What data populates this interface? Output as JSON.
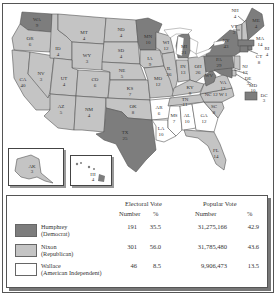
{
  "colors": {
    "humphrey": "#7d7d7d",
    "nixon": "#c4c4c4",
    "wallace": "#ffffff",
    "border": "#555555"
  },
  "states": [
    {
      "abbr": "WA",
      "ev": "9",
      "winner": "humphrey"
    },
    {
      "abbr": "OR",
      "ev": "6",
      "winner": "nixon"
    },
    {
      "abbr": "CA",
      "ev": "40",
      "winner": "nixon"
    },
    {
      "abbr": "ID",
      "ev": "4",
      "winner": "nixon"
    },
    {
      "abbr": "NV",
      "ev": "3",
      "winner": "nixon"
    },
    {
      "abbr": "MT",
      "ev": "4",
      "winner": "nixon"
    },
    {
      "abbr": "WY",
      "ev": "3",
      "winner": "nixon"
    },
    {
      "abbr": "UT",
      "ev": "4",
      "winner": "nixon"
    },
    {
      "abbr": "AZ",
      "ev": "5",
      "winner": "nixon"
    },
    {
      "abbr": "CO",
      "ev": "6",
      "winner": "nixon"
    },
    {
      "abbr": "NM",
      "ev": "4",
      "winner": "nixon"
    },
    {
      "abbr": "ND",
      "ev": "4",
      "winner": "nixon"
    },
    {
      "abbr": "SD",
      "ev": "4",
      "winner": "nixon"
    },
    {
      "abbr": "NE",
      "ev": "5",
      "winner": "nixon"
    },
    {
      "abbr": "KS",
      "ev": "7",
      "winner": "nixon"
    },
    {
      "abbr": "OK",
      "ev": "8",
      "winner": "nixon"
    },
    {
      "abbr": "TX",
      "ev": "25",
      "winner": "humphrey"
    },
    {
      "abbr": "MN",
      "ev": "10",
      "winner": "humphrey"
    },
    {
      "abbr": "IA",
      "ev": "9",
      "winner": "nixon"
    },
    {
      "abbr": "MO",
      "ev": "12",
      "winner": "nixon"
    },
    {
      "abbr": "AR",
      "ev": "6",
      "winner": "wallace"
    },
    {
      "abbr": "LA",
      "ev": "10",
      "winner": "wallace"
    },
    {
      "abbr": "WI",
      "ev": "12",
      "winner": "nixon"
    },
    {
      "abbr": "IL",
      "ev": "26",
      "winner": "nixon"
    },
    {
      "abbr": "MI",
      "ev": "21",
      "winner": "humphrey"
    },
    {
      "abbr": "IN",
      "ev": "13",
      "winner": "nixon"
    },
    {
      "abbr": "OH",
      "ev": "26",
      "winner": "nixon"
    },
    {
      "abbr": "KY",
      "ev": "9",
      "winner": "nixon"
    },
    {
      "abbr": "TN",
      "ev": "11",
      "winner": "nixon"
    },
    {
      "abbr": "MS",
      "ev": "7",
      "winner": "wallace"
    },
    {
      "abbr": "AL",
      "ev": "10",
      "winner": "wallace"
    },
    {
      "abbr": "GA",
      "ev": "12",
      "winner": "wallace"
    },
    {
      "abbr": "FL",
      "ev": "14",
      "winner": "nixon"
    },
    {
      "abbr": "SC",
      "ev": "8",
      "winner": "nixon"
    },
    {
      "abbr": "NC",
      "ev": "12",
      "winner": "nixon"
    },
    {
      "abbr": "NC-W",
      "ev": "1",
      "winner": "wallace"
    },
    {
      "abbr": "VA",
      "ev": "12",
      "winner": "nixon"
    },
    {
      "abbr": "WV",
      "ev": "7",
      "winner": "humphrey"
    },
    {
      "abbr": "PA",
      "ev": "29",
      "winner": "humphrey"
    },
    {
      "abbr": "NY",
      "ev": "43",
      "winner": "humphrey"
    },
    {
      "abbr": "VT",
      "ev": "3",
      "winner": "nixon"
    },
    {
      "abbr": "NH",
      "ev": "4",
      "winner": "nixon"
    },
    {
      "abbr": "ME",
      "ev": "4",
      "winner": "humphrey"
    },
    {
      "abbr": "MA",
      "ev": "14",
      "winner": "humphrey"
    },
    {
      "abbr": "RI",
      "ev": "4",
      "winner": "humphrey"
    },
    {
      "abbr": "CT",
      "ev": "8",
      "winner": "humphrey"
    },
    {
      "abbr": "NJ",
      "ev": "17",
      "winner": "nixon"
    },
    {
      "abbr": "DE",
      "ev": "3",
      "winner": "nixon"
    },
    {
      "abbr": "MD",
      "ev": "10",
      "winner": "humphrey"
    },
    {
      "abbr": "DC",
      "ev": "3",
      "winner": "humphrey"
    },
    {
      "abbr": "AK",
      "ev": "3",
      "winner": "nixon"
    },
    {
      "abbr": "HI",
      "ev": "4",
      "winner": "humphrey"
    }
  ],
  "legend": {
    "header": {
      "electoral": "Electoral Vote",
      "popular": "Popular Vote",
      "number": "Number",
      "percent": "%"
    },
    "rows": [
      {
        "name": "Humphrey",
        "party": "(Democrat)",
        "ev_number": "191",
        "ev_pct": "35.5",
        "pop_number": "31,275,166",
        "pop_pct": "42.9"
      },
      {
        "name": "Nixon",
        "party": "(Republican)",
        "ev_number": "301",
        "ev_pct": "56.0",
        "pop_number": "31,785,480",
        "pop_pct": "43.6"
      },
      {
        "name": "Wallace",
        "party": "(American Independent)",
        "ev_number": "46",
        "ev_pct": "8.5",
        "pop_number": "9,906,473",
        "pop_pct": "13.5"
      }
    ]
  }
}
